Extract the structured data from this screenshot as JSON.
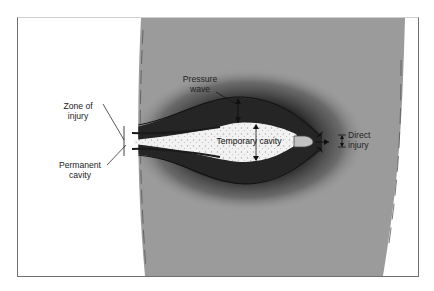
{
  "diagram": {
    "type": "gunshot wound ballistics cross-section",
    "colors": {
      "background": "#ffffff",
      "frame_border": "#6f6f6f",
      "tissue": "#9b9b9b",
      "pressure_zone": "#2a2a2a",
      "temporary_cavity": "#f4f4f4",
      "bullet": "#b8b8b8"
    },
    "labels": {
      "pressure_wave_line1": "Pressure",
      "pressure_wave_line2": "wave",
      "zone_of_injury_line1": "Zone of",
      "zone_of_injury_line2": "injury",
      "permanent_cavity_line1": "Permanent",
      "permanent_cavity_line2": "cavity",
      "temporary_cavity": "Temporary cavity",
      "direct_injury_line1": "Direct",
      "direct_injury_line2": "injury"
    }
  }
}
